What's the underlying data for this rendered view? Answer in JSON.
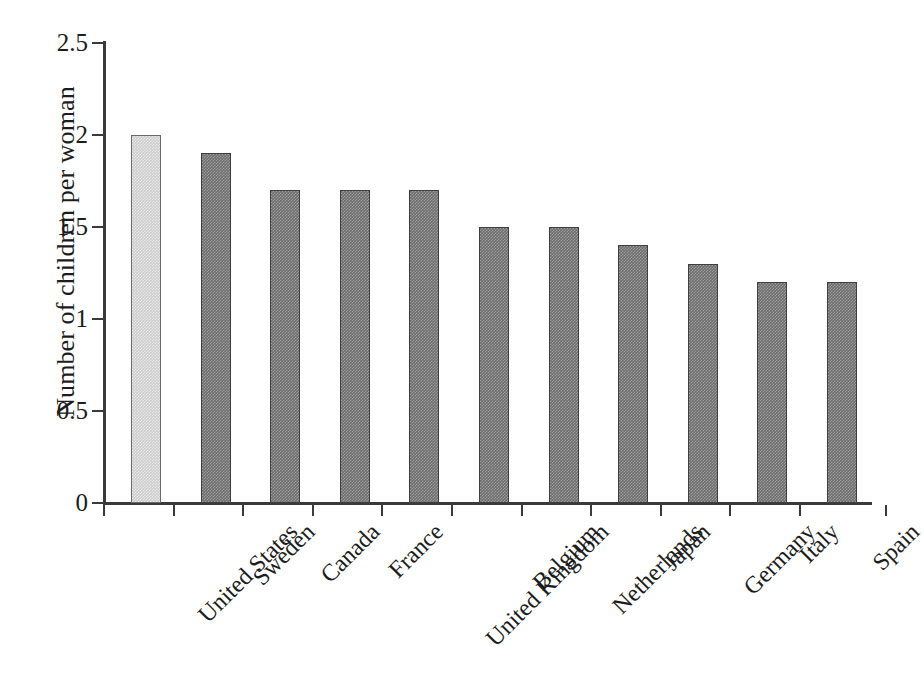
{
  "chart_data": {
    "type": "bar",
    "title": "",
    "subtitle": "",
    "xlabel": "",
    "ylabel": "Number of children per woman",
    "ylim": [
      0,
      2.5
    ],
    "yticks": [
      "0",
      "0.5",
      "1",
      "1.5",
      "2",
      "2.5"
    ],
    "ytick_values": [
      0,
      0.5,
      1,
      1.5,
      2,
      2.5
    ],
    "grid": false,
    "legend": "none",
    "categories": [
      "United States",
      "Sweden",
      "Canada",
      "France",
      "United Kingdom",
      "Belgium",
      "Netherlands",
      "Japan",
      "Germany",
      "Italy",
      "Spain"
    ],
    "values": [
      2.0,
      1.9,
      1.7,
      1.7,
      1.7,
      1.5,
      1.5,
      1.4,
      1.3,
      1.2,
      1.2
    ],
    "series": [
      {
        "name": "Total fertility rate",
        "values": [
          2.0,
          1.9,
          1.7,
          1.7,
          1.7,
          1.5,
          1.5,
          1.4,
          1.3,
          1.2,
          1.2
        ]
      }
    ],
    "highlight_index": 0,
    "annotations": []
  },
  "colors": {
    "background": "#ffffff",
    "axis": "#3a3a3a",
    "text": "#1c1c1c",
    "bar_default": "#6e6e6e",
    "bar_highlight": "#cccccc",
    "bar_border_default": "#3f3f3f",
    "bar_border_highlight": "#6a6a6a"
  }
}
